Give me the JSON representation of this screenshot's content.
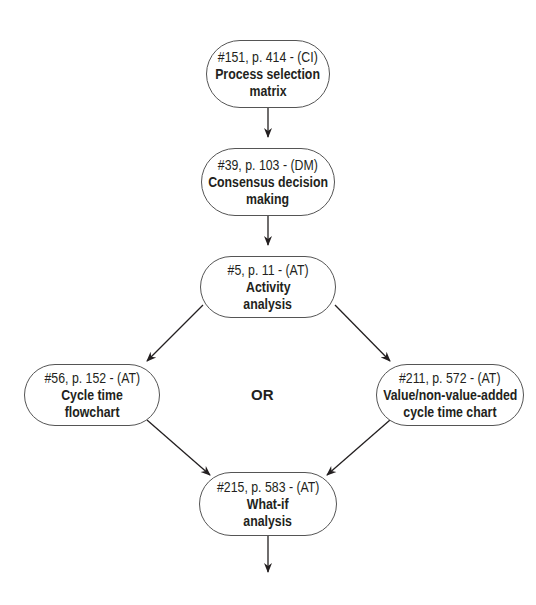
{
  "diagram": {
    "type": "flowchart",
    "nodes": [
      {
        "id": "n1",
        "ref": "#151, p. 414 - (CI)",
        "title_line1": "Process selection",
        "title_line2": "matrix"
      },
      {
        "id": "n2",
        "ref": "#39, p. 103 - (DM)",
        "title_line1": "Consensus decision",
        "title_line2": "making"
      },
      {
        "id": "n3",
        "ref": "#5, p. 11 - (AT)",
        "title_line1": "Activity",
        "title_line2": "analysis"
      },
      {
        "id": "n4",
        "ref": "#56, p. 152 - (AT)",
        "title_line1": "Cycle time",
        "title_line2": "flowchart"
      },
      {
        "id": "n5",
        "ref": "#211, p. 572 - (AT)",
        "title_line1": "Value/non-value-added",
        "title_line2": "cycle time chart"
      },
      {
        "id": "n6",
        "ref": "#215, p. 583 - (AT)",
        "title_line1": "What-if",
        "title_line2": "analysis"
      }
    ],
    "or_label": "OR",
    "edges": [
      {
        "from": "n1",
        "to": "n2"
      },
      {
        "from": "n2",
        "to": "n3"
      },
      {
        "from": "n3",
        "to": "n4"
      },
      {
        "from": "n3",
        "to": "n5"
      },
      {
        "from": "n4",
        "to": "n6"
      },
      {
        "from": "n5",
        "to": "n6"
      },
      {
        "from": "n6",
        "to": "next"
      }
    ]
  }
}
